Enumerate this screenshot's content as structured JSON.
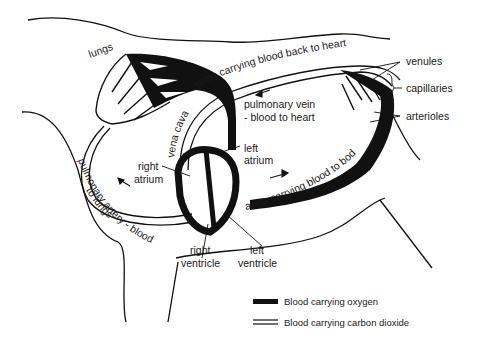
{
  "diagram": {
    "type": "circulatory-system",
    "labels": {
      "lungs": "lungs",
      "veins": "veins carrying blood back to heart",
      "venules": "venules",
      "capillaries": "capillaries",
      "arterioles": "arterioles",
      "pulmonary_vein_1": "pulmonary vein",
      "pulmonary_vein_2": "- blood to heart",
      "vena_cava": "vena cava",
      "right_atrium_1": "right",
      "right_atrium_2": "atrium",
      "left_atrium_1": "left",
      "left_atrium_2": "atrium",
      "pulmonary_artery_1": "pulmonary artery - blood",
      "pulmonary_artery_2": "to lungs",
      "aorta": "aorta carrying blood to body",
      "right_ventricle_1": "right",
      "right_ventricle_2": "ventricle",
      "left_ventricle_1": "left",
      "left_ventricle_2": "ventricle"
    },
    "legend": [
      {
        "symbol": "solid-thick-line",
        "label": "Blood carrying oxygen"
      },
      {
        "symbol": "double-line",
        "label": "Blood carrying carbon dioxide"
      }
    ],
    "colors": {
      "ink": "#111111",
      "background": "#ffffff"
    }
  }
}
